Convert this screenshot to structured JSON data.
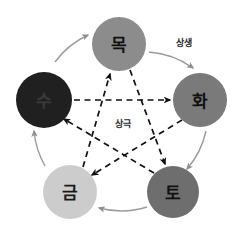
{
  "diagram": {
    "background_color": "#ffffff",
    "nodes": [
      {
        "id": "mok",
        "label": "목",
        "meaning": "wood",
        "position": "top",
        "cx": 119,
        "cy": 44,
        "r": 27,
        "fill": "#8c8c8c",
        "text_class": "node-label-dark"
      },
      {
        "id": "hwa",
        "label": "화",
        "meaning": "fire",
        "position": "right",
        "cx": 200,
        "cy": 100,
        "r": 27,
        "fill": "#7a7a7a",
        "text_class": "node-label-dark"
      },
      {
        "id": "to",
        "label": "토",
        "meaning": "earth",
        "position": "bottom-right",
        "cx": 173,
        "cy": 192,
        "r": 26,
        "fill": "#6e6e6e",
        "text_class": "node-label-dark"
      },
      {
        "id": "geum",
        "label": "금",
        "meaning": "metal",
        "position": "bottom-left",
        "cx": 70,
        "cy": 192,
        "r": 27,
        "fill": "#cccccc",
        "text_class": "node-label-light"
      },
      {
        "id": "su",
        "label": "수",
        "meaning": "water",
        "position": "left",
        "cx": 44,
        "cy": 100,
        "r": 28,
        "fill": "#202020",
        "text_class": "node-label-onblack"
      }
    ],
    "relations": {
      "sangsaeng": {
        "label": "상생",
        "label_x": 184,
        "label_y": 43,
        "style": "solid-arc",
        "color": "#9a9a9a",
        "sequence": [
          "수",
          "목",
          "화",
          "토",
          "금",
          "수"
        ]
      },
      "sanggeuk": {
        "label": "상극",
        "label_x": 123,
        "label_y": 124,
        "style": "dashed-straight",
        "color": "#111111",
        "sequence": [
          "수",
          "화",
          "금",
          "목",
          "토",
          "수"
        ]
      }
    }
  }
}
